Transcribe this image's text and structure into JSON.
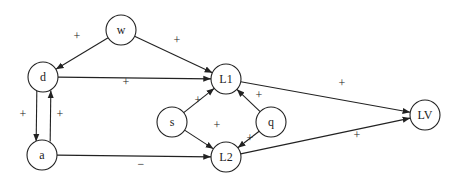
{
  "diagram": {
    "nodes": [
      {
        "id": "w",
        "label": "w",
        "x": 121,
        "y": 30
      },
      {
        "id": "d",
        "label": "d",
        "x": 43,
        "y": 77
      },
      {
        "id": "a",
        "label": "a",
        "x": 42,
        "y": 155
      },
      {
        "id": "L1",
        "label": "L1",
        "x": 226,
        "y": 79
      },
      {
        "id": "s",
        "label": "s",
        "x": 172,
        "y": 122
      },
      {
        "id": "q",
        "label": "q",
        "x": 271,
        "y": 122
      },
      {
        "id": "L2",
        "label": "L2",
        "x": 226,
        "y": 157
      },
      {
        "id": "LV",
        "label": "LV",
        "x": 425,
        "y": 115
      }
    ],
    "edges": [
      {
        "from": "w",
        "to": "d",
        "sign": "+",
        "lx": 77,
        "ly": 37
      },
      {
        "from": "w",
        "to": "L1",
        "sign": "+",
        "lx": 177,
        "ly": 41
      },
      {
        "from": "d",
        "to": "L1",
        "sign": "+",
        "lx": 126,
        "ly": 83
      },
      {
        "from": "d",
        "to": "a",
        "sign": "+",
        "lx": 23,
        "ly": 115
      },
      {
        "from": "a",
        "to": "d",
        "sign": "+",
        "lx": 60,
        "ly": 115
      },
      {
        "from": "a",
        "to": "L2",
        "sign": "−",
        "lx": 141,
        "ly": 165
      },
      {
        "from": "s",
        "to": "L1",
        "sign": "+",
        "lx": 198,
        "ly": 101
      },
      {
        "from": "s",
        "to": "L2",
        "sign": "+",
        "lx": 217,
        "ly": 126
      },
      {
        "from": "q",
        "to": "L1",
        "sign": "+",
        "lx": 259,
        "ly": 96
      },
      {
        "from": "q",
        "to": "L2",
        "sign": "+",
        "lx": 250,
        "ly": 139
      },
      {
        "from": "L1",
        "to": "LV",
        "sign": "+",
        "lx": 342,
        "ly": 84
      },
      {
        "from": "L2",
        "to": "LV",
        "sign": "+",
        "lx": 357,
        "ly": 136
      }
    ]
  }
}
